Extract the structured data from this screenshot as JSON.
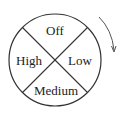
{
  "dial": {
    "segments": [
      {
        "position": "top",
        "label": "Off"
      },
      {
        "position": "right",
        "label": "Low"
      },
      {
        "position": "bottom",
        "label": "Medium"
      },
      {
        "position": "left",
        "label": "High"
      }
    ],
    "rotation_direction": "clockwise",
    "line_color": "#333333",
    "background": "#ffffff"
  }
}
